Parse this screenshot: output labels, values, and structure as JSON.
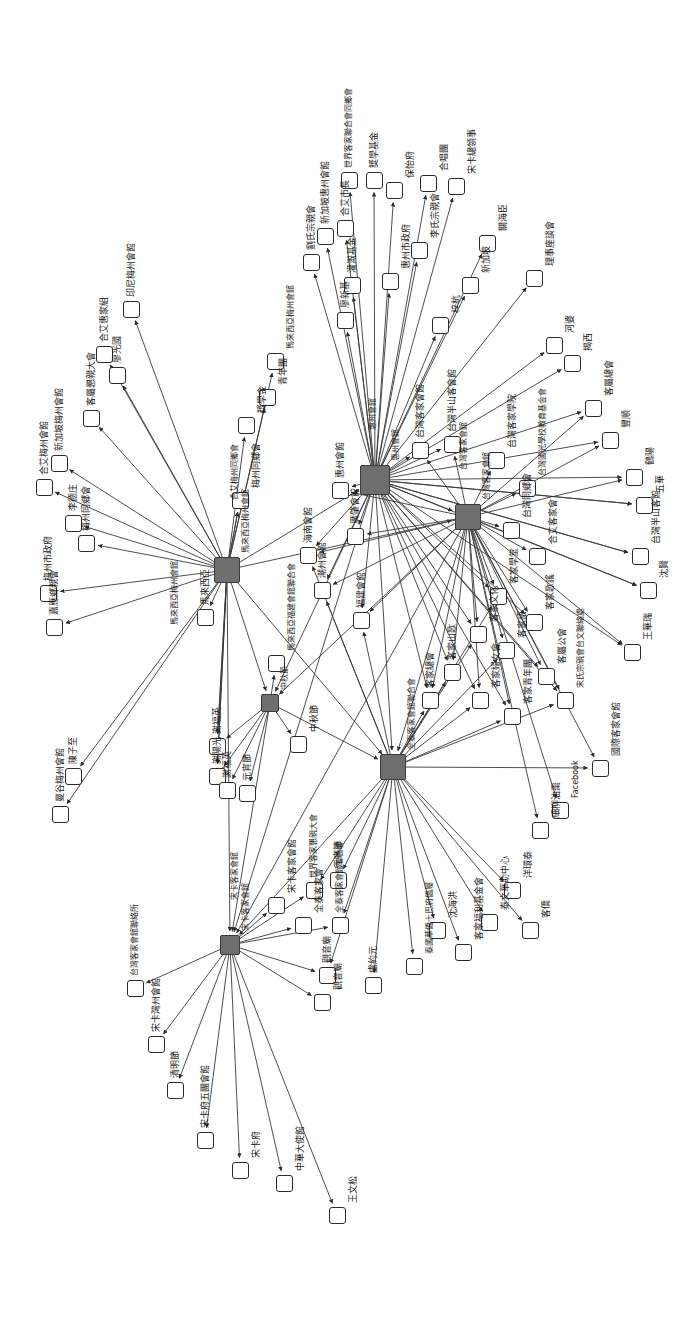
{
  "graph": {
    "title": "客家社團關係網絡圖",
    "type": "directed-network",
    "orientation": "rotated-90",
    "canvas": {
      "width": 688,
      "height": 1321
    },
    "style": {
      "hub_fill": "#6e6e6e",
      "leaf_fill": "#ffffff",
      "stroke": "#2b2b2b",
      "edge_color": "#3a3a3a",
      "background": "#ffffff"
    },
    "hubs": [
      {
        "id": "h1",
        "label": "馬來西亞梅州會館",
        "x": 227,
        "y": 570,
        "size": 26
      },
      {
        "id": "h2",
        "label": "惠州會館",
        "x": 375,
        "y": 480,
        "size": 30
      },
      {
        "id": "h3",
        "label": "台灣客家會館",
        "x": 468,
        "y": 517,
        "size": 26
      },
      {
        "id": "h4",
        "label": "中秋節",
        "x": 270,
        "y": 703,
        "size": 18
      },
      {
        "id": "h5",
        "label": "全泰客家會館聯合會",
        "x": 393,
        "y": 767,
        "size": 26
      },
      {
        "id": "h6",
        "label": "宋卡客家會館",
        "x": 230,
        "y": 945,
        "size": 20
      }
    ],
    "nodes": [
      {
        "id": "n1",
        "label": "印尼梅州會館",
        "x": 131,
        "y": 309,
        "hub": "h1"
      },
      {
        "id": "n2",
        "label": "合艾惠家組",
        "x": 104,
        "y": 354,
        "hub": "h1"
      },
      {
        "id": "n3",
        "label": "廖光國",
        "x": 117,
        "y": 375,
        "hub": "h1"
      },
      {
        "id": "n4",
        "label": "客屬懇親大會",
        "x": 91,
        "y": 418,
        "hub": "h1"
      },
      {
        "id": "n5",
        "label": "新加坡梅州會館",
        "x": 59,
        "y": 463,
        "hub": "h1"
      },
      {
        "id": "n6",
        "label": "合艾梅州會館",
        "x": 44,
        "y": 487,
        "hub": "h1"
      },
      {
        "id": "n7",
        "label": "李德庄",
        "x": 73,
        "y": 523,
        "hub": "h1"
      },
      {
        "id": "n8",
        "label": "梅州同鄉會",
        "x": 86,
        "y": 543,
        "hub": "h1"
      },
      {
        "id": "n9",
        "label": "梅州市政府",
        "x": 48,
        "y": 593,
        "hub": "h1"
      },
      {
        "id": "n10",
        "label": "嘉應鄉親會",
        "x": 54,
        "y": 627,
        "hub": "h1"
      },
      {
        "id": "n11",
        "label": "獎學金",
        "x": 246,
        "y": 425,
        "hub": "h1"
      },
      {
        "id": "n12",
        "label": "馬來西亞梅州會館",
        "x": 275,
        "y": 361,
        "hub": "h1"
      },
      {
        "id": "n13",
        "label": "青年團",
        "x": 267,
        "y": 397,
        "hub": "h1"
      },
      {
        "id": "n14",
        "label": "梅州同鄉會",
        "x": 240,
        "y": 500,
        "hub": "h1"
      },
      {
        "id": "n15",
        "label": "馬來西亞",
        "x": 205,
        "y": 617,
        "hub": "h1"
      },
      {
        "id": "n16",
        "label": "陳子至",
        "x": 73,
        "y": 776,
        "hub": "h1"
      },
      {
        "id": "n17",
        "label": "曼谷梅州會館",
        "x": 60,
        "y": 814,
        "hub": "h1"
      },
      {
        "id": "n18",
        "label": "謝福英",
        "x": 217,
        "y": 746,
        "hub": "h1"
      },
      {
        "id": "n19",
        "label": "謝陽光",
        "x": 217,
        "y": 776,
        "hub": "h1"
      },
      {
        "id": "n20",
        "label": "世界客家聯合會同鄉會",
        "x": 349,
        "y": 180,
        "hub": "h2"
      },
      {
        "id": "n21",
        "label": "劉氏宗親會",
        "x": 311,
        "y": 262,
        "hub": "h2"
      },
      {
        "id": "n22",
        "label": "新加坡惠州會館",
        "x": 325,
        "y": 236,
        "hub": "h2"
      },
      {
        "id": "n23",
        "label": "合艾市長",
        "x": 345,
        "y": 228,
        "hub": "h2"
      },
      {
        "id": "n24",
        "label": "灌溉基金",
        "x": 352,
        "y": 285,
        "hub": "h2"
      },
      {
        "id": "n25",
        "label": "廖新基",
        "x": 345,
        "y": 320,
        "hub": "h2"
      },
      {
        "id": "n26",
        "label": "惠州市政府",
        "x": 390,
        "y": 281,
        "hub": "h2"
      },
      {
        "id": "n27",
        "label": "保怡府",
        "x": 394,
        "y": 190,
        "hub": "h2"
      },
      {
        "id": "n28",
        "label": "獎學基金",
        "x": 374,
        "y": 180,
        "hub": "h2"
      },
      {
        "id": "n29",
        "label": "李氏宗親會",
        "x": 419,
        "y": 250,
        "hub": "h2"
      },
      {
        "id": "n30",
        "label": "合唱團",
        "x": 428,
        "y": 183,
        "hub": "h2"
      },
      {
        "id": "n31",
        "label": "宋卡總領事",
        "x": 456,
        "y": 186,
        "hub": "h2"
      },
      {
        "id": "n32",
        "label": "新加坡",
        "x": 470,
        "y": 285,
        "hub": "h2"
      },
      {
        "id": "n33",
        "label": "關海臣",
        "x": 487,
        "y": 243,
        "hub": "h2"
      },
      {
        "id": "n34",
        "label": "梓杭",
        "x": 440,
        "y": 325,
        "hub": "h2"
      },
      {
        "id": "n35",
        "label": "理事座談會",
        "x": 534,
        "y": 278,
        "hub": "h2"
      },
      {
        "id": "n36",
        "label": "河婆",
        "x": 554,
        "y": 345,
        "hub": "h2"
      },
      {
        "id": "n37",
        "label": "揭西",
        "x": 572,
        "y": 363,
        "hub": "h2"
      },
      {
        "id": "n38",
        "label": "客屬總會",
        "x": 593,
        "y": 408,
        "hub": "h2"
      },
      {
        "id": "n39",
        "label": "豐順",
        "x": 610,
        "y": 440,
        "hub": "h2"
      },
      {
        "id": "n40",
        "label": "鶴陽",
        "x": 634,
        "y": 477,
        "hub": "h2"
      },
      {
        "id": "n41",
        "label": "五華",
        "x": 644,
        "y": 505,
        "hub": "h2"
      },
      {
        "id": "n42",
        "label": "台灣半山客館",
        "x": 640,
        "y": 556,
        "hub": "h2"
      },
      {
        "id": "n43",
        "label": "沈賢",
        "x": 648,
        "y": 590,
        "hub": "h2"
      },
      {
        "id": "n44",
        "label": "王華瑞",
        "x": 632,
        "y": 652,
        "hub": "h2"
      },
      {
        "id": "n45",
        "label": "惠州會館",
        "x": 340,
        "y": 490,
        "hub": "h2"
      },
      {
        "id": "n46",
        "label": "海南會館",
        "x": 308,
        "y": 555,
        "hub": "h2"
      },
      {
        "id": "n47",
        "label": "潮州會館",
        "x": 322,
        "y": 590,
        "hub": "h2"
      },
      {
        "id": "n48",
        "label": "廣肇會館",
        "x": 355,
        "y": 536,
        "hub": "h2"
      },
      {
        "id": "n49",
        "label": "福建會館",
        "x": 361,
        "y": 620,
        "hub": "h2"
      },
      {
        "id": "n50",
        "label": "台灣客家會館",
        "x": 420,
        "y": 450,
        "hub": "h3"
      },
      {
        "id": "n51",
        "label": "台灣半山客會館",
        "x": 452,
        "y": 444,
        "hub": "h3"
      },
      {
        "id": "n52",
        "label": "台灣客家學院",
        "x": 496,
        "y": 460,
        "hub": "h3"
      },
      {
        "id": "n53",
        "label": "台灣國光學校教育基金會",
        "x": 527,
        "y": 488,
        "hub": "h3"
      },
      {
        "id": "n54",
        "label": "台灣同鄉會",
        "x": 511,
        "y": 530,
        "hub": "h3"
      },
      {
        "id": "n55",
        "label": "合艾客家會",
        "x": 537,
        "y": 556,
        "hub": "h3"
      },
      {
        "id": "n56",
        "label": "宋氏宗親會台文聯絡處",
        "x": 565,
        "y": 700,
        "hub": "h3"
      },
      {
        "id": "n57",
        "label": "國際客家會館",
        "x": 600,
        "y": 768,
        "hub": "h3"
      },
      {
        "id": "n58",
        "label": "Facebook",
        "x": 560,
        "y": 810,
        "hub": "h3"
      },
      {
        "id": "n59",
        "label": "細柳油棗",
        "x": 540,
        "y": 830,
        "hub": "h3"
      },
      {
        "id": "n60",
        "label": "客家學堂",
        "x": 498,
        "y": 596,
        "hub": "h3"
      },
      {
        "id": "n61",
        "label": "客家文化",
        "x": 478,
        "y": 634,
        "hub": "h3"
      },
      {
        "id": "n62",
        "label": "客家語",
        "x": 506,
        "y": 650,
        "hub": "h3"
      },
      {
        "id": "n63",
        "label": "客家歌謠",
        "x": 534,
        "y": 622,
        "hub": "h3"
      },
      {
        "id": "n64",
        "label": "客家山歌",
        "x": 452,
        "y": 672,
        "hub": "h3"
      },
      {
        "id": "n65",
        "label": "客家婦女會",
        "x": 480,
        "y": 700,
        "hub": "h3"
      },
      {
        "id": "n66",
        "label": "客家青年團",
        "x": 512,
        "y": 716,
        "hub": "h3"
      },
      {
        "id": "n67",
        "label": "客家總會",
        "x": 430,
        "y": 700,
        "hub": "h3"
      },
      {
        "id": "n68",
        "label": "客屬公會",
        "x": 546,
        "y": 676,
        "hub": "h3"
      },
      {
        "id": "n69",
        "label": "中秋節",
        "x": 298,
        "y": 744,
        "hub": "h4"
      },
      {
        "id": "n70",
        "label": "馬來西亞福建會館聯合會",
        "x": 276,
        "y": 663,
        "hub": "h4"
      },
      {
        "id": "n71",
        "label": "元宵節",
        "x": 247,
        "y": 793,
        "hub": "h4"
      },
      {
        "id": "n72",
        "label": "謝福英",
        "x": 227,
        "y": 790,
        "hub": "h4"
      },
      {
        "id": "n73",
        "label": "世界客家懇親大會",
        "x": 314,
        "y": 890,
        "hub": "h5"
      },
      {
        "id": "n74",
        "label": "全泰客家會館聯合會",
        "x": 340,
        "y": 925,
        "hub": "h5"
      },
      {
        "id": "n75",
        "label": "元宵節",
        "x": 338,
        "y": 880,
        "hub": "h5"
      },
      {
        "id": "n76",
        "label": "觀音廟",
        "x": 327,
        "y": 975,
        "hub": "h5"
      },
      {
        "id": "n77",
        "label": "盧約元",
        "x": 373,
        "y": 985,
        "hub": "h5"
      },
      {
        "id": "n78",
        "label": "泰國華僑十巴府僑屬",
        "x": 414,
        "y": 966,
        "hub": "h5"
      },
      {
        "id": "n79",
        "label": "沈海洪",
        "x": 437,
        "y": 930,
        "hub": "h5"
      },
      {
        "id": "n80",
        "label": "客家福利基金會",
        "x": 463,
        "y": 952,
        "hub": "h5"
      },
      {
        "id": "n81",
        "label": "泰文華助中心",
        "x": 489,
        "y": 922,
        "hub": "h5"
      },
      {
        "id": "n82",
        "label": "洋環泰",
        "x": 512,
        "y": 890,
        "hub": "h5"
      },
      {
        "id": "n83",
        "label": "客僑",
        "x": 530,
        "y": 930,
        "hub": "h5"
      },
      {
        "id": "n84",
        "label": "台灣客家會館聯絡所",
        "x": 135,
        "y": 988,
        "hub": "h6"
      },
      {
        "id": "n85",
        "label": "宋卡灣州會館",
        "x": 156,
        "y": 1044,
        "hub": "h6"
      },
      {
        "id": "n86",
        "label": "清明節",
        "x": 175,
        "y": 1090,
        "hub": "h6"
      },
      {
        "id": "n87",
        "label": "宋卡府五團會館",
        "x": 205,
        "y": 1140,
        "hub": "h6"
      },
      {
        "id": "n88",
        "label": "宋卡府",
        "x": 240,
        "y": 1170,
        "hub": "h6"
      },
      {
        "id": "n89",
        "label": "中華大使館",
        "x": 284,
        "y": 1183,
        "hub": "h6"
      },
      {
        "id": "n90",
        "label": "王文松",
        "x": 337,
        "y": 1215,
        "hub": "h6"
      },
      {
        "id": "n91",
        "label": "宋卡客家會館",
        "x": 276,
        "y": 905,
        "hub": "h6"
      },
      {
        "id": "n92",
        "label": "全泰客家會",
        "x": 303,
        "y": 925,
        "hub": "h6"
      },
      {
        "id": "n93",
        "label": "觀音廟",
        "x": 322,
        "y": 1002,
        "hub": "h6"
      }
    ],
    "extra_labels": [
      {
        "text": "馬來西亞梅州會館",
        "x": 171,
        "y": 625
      },
      {
        "text": "合艾梅州同鄉會",
        "x": 231,
        "y": 500
      },
      {
        "text": "惠州會館",
        "x": 369,
        "y": 430
      },
      {
        "text": "台灣客家會館",
        "x": 460,
        "y": 470
      },
      {
        "text": "宋卡客家會館",
        "x": 231,
        "y": 900
      }
    ]
  }
}
